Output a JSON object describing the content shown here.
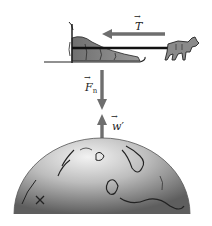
{
  "diagram": {
    "forces": [
      {
        "id": "tension",
        "symbol": "T",
        "subscript": "",
        "prime": "",
        "direction": "left",
        "color": "#6e6e6e"
      },
      {
        "id": "normal",
        "symbol": "F",
        "subscript": "n",
        "prime": "",
        "direction": "down",
        "color": "#6e6e6e"
      },
      {
        "id": "weight-reaction",
        "symbol": "w",
        "subscript": "",
        "prime": "′",
        "direction": "up",
        "color": "#6e6e6e"
      }
    ],
    "objects": [
      {
        "id": "sled",
        "label": "sled"
      },
      {
        "id": "dog",
        "label": "dog"
      },
      {
        "id": "rope",
        "label": "rope"
      },
      {
        "id": "earth",
        "label": "Earth globe"
      }
    ],
    "colors": {
      "arrow": "#6e6e6e",
      "sled_body": "#7a7a7a",
      "globe_light": "#e8e8e8",
      "globe_dark": "#6a6a6a",
      "outline": "#111111"
    }
  }
}
